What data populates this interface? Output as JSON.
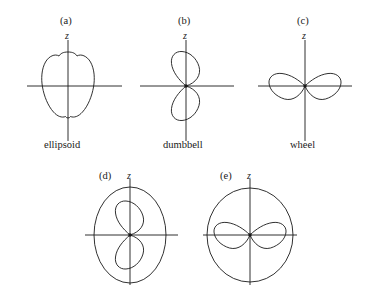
{
  "figure": {
    "background_color": "#ffffff",
    "line_color": "#1a1a1a",
    "panels": [
      {
        "tag": "(a)",
        "axis_label": "z",
        "caption": "ellipsoid",
        "shape": "ellipsoid",
        "center": {
          "x": 68,
          "y": 86
        },
        "tag_pos": {
          "x": 60,
          "y": 16
        },
        "axis_label_pos": {
          "x": 65,
          "y": 31
        },
        "caption_pos": {
          "x": 44,
          "y": 140
        },
        "x_axis": {
          "x1": 27,
          "x2": 122
        },
        "z_axis": {
          "y1": 40,
          "y2": 141
        },
        "has_center_dot": false
      },
      {
        "tag": "(b)",
        "axis_label": "z",
        "caption": "dumbbell",
        "shape": "dumbbell",
        "center": {
          "x": 186,
          "y": 86
        },
        "tag_pos": {
          "x": 178,
          "y": 16
        },
        "axis_label_pos": {
          "x": 183,
          "y": 31
        },
        "caption_pos": {
          "x": 163,
          "y": 140
        },
        "x_axis": {
          "x1": 140,
          "x2": 234
        },
        "z_axis": {
          "y1": 40,
          "y2": 141
        },
        "has_center_dot": true
      },
      {
        "tag": "(c)",
        "axis_label": "z",
        "caption": "wheel",
        "shape": "wheel",
        "center": {
          "x": 305,
          "y": 86
        },
        "tag_pos": {
          "x": 297,
          "y": 16
        },
        "axis_label_pos": {
          "x": 302,
          "y": 31
        },
        "caption_pos": {
          "x": 290,
          "y": 140
        },
        "x_axis": {
          "x1": 258,
          "x2": 352
        },
        "z_axis": {
          "y1": 40,
          "y2": 141
        },
        "has_center_dot": true
      },
      {
        "tag": "(d)",
        "axis_label": "z",
        "caption": "",
        "shape": "dumbbell-in-ellipse",
        "center": {
          "x": 130,
          "y": 235
        },
        "tag_pos": {
          "x": 99,
          "y": 171
        },
        "axis_label_pos": {
          "x": 127,
          "y": 171
        },
        "caption_pos": null,
        "x_axis": {
          "x1": 85,
          "x2": 178
        },
        "z_axis": {
          "y1": 179,
          "y2": 285
        },
        "has_center_dot": true
      },
      {
        "tag": "(e)",
        "axis_label": "z",
        "caption": "",
        "shape": "wheel-in-circle",
        "center": {
          "x": 250,
          "y": 235
        },
        "tag_pos": {
          "x": 220,
          "y": 171
        },
        "axis_label_pos": {
          "x": 247,
          "y": 171
        },
        "caption_pos": null,
        "x_axis": {
          "x1": 203,
          "x2": 297
        },
        "z_axis": {
          "y1": 179,
          "y2": 285
        },
        "has_center_dot": true
      }
    ]
  }
}
